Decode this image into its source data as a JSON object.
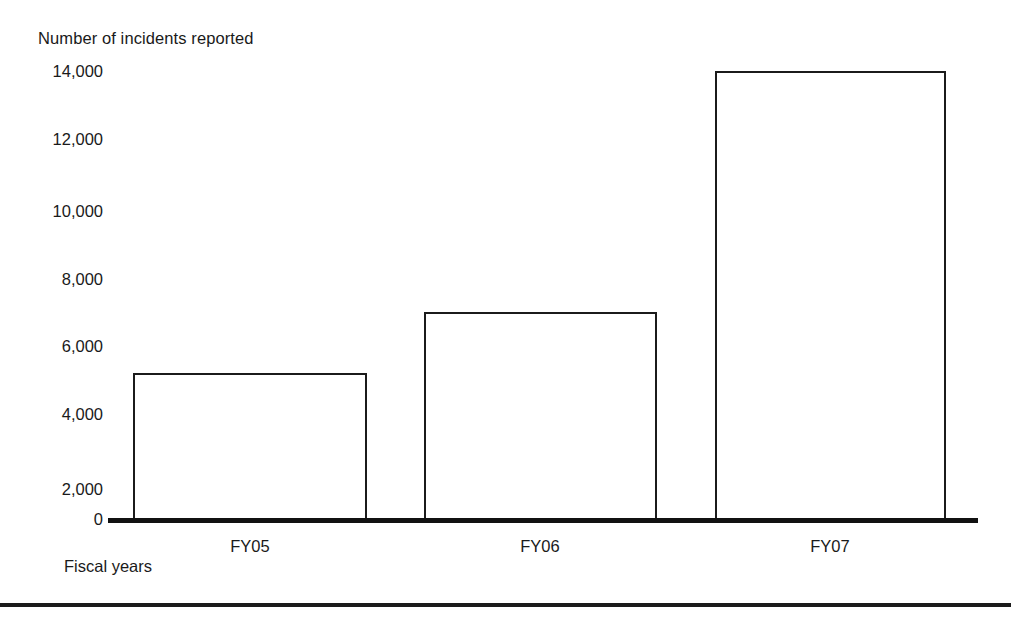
{
  "chart_data": {
    "type": "bar",
    "title": "",
    "ylabel": "Number of incidents reported",
    "xlabel": "Fiscal years",
    "categories": [
      "FY05",
      "FY06",
      "FY07"
    ],
    "values": [
      4600,
      6500,
      14000
    ],
    "ytick_labels": [
      "14,000",
      "12,000",
      "10,000",
      "8,000",
      "6,000",
      "4,000",
      "2,000",
      "0"
    ],
    "ytick_values": [
      14000,
      12000,
      10000,
      8000,
      6000,
      4000,
      2000,
      0
    ],
    "ylim": [
      0,
      14000
    ],
    "grid": false,
    "legend": false,
    "bar_fill": "#ffffff",
    "bar_outline": "#1b1b1b",
    "axis_color": "#111111",
    "series": [
      {
        "name": "Number of incidents reported",
        "values": [
          4600,
          6500,
          14000
        ]
      }
    ]
  },
  "colors": {
    "background": "#ffffff",
    "text": "#1a1a1a",
    "rule": "#1b1b1b"
  }
}
